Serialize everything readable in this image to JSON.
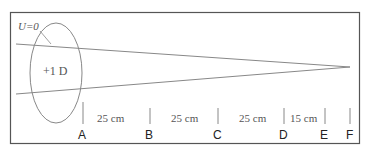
{
  "diagram": {
    "vergence_label": "U=0",
    "lens_label": "+1 D",
    "points": [
      "A",
      "B",
      "C",
      "D",
      "E",
      "F"
    ],
    "segments": [
      {
        "label": "25 cm",
        "from": "A",
        "to": "B"
      },
      {
        "label": "25 cm",
        "from": "B",
        "to": "C"
      },
      {
        "label": "25 cm",
        "from": "C",
        "to": "D"
      },
      {
        "label": "15 cm",
        "from": "D",
        "to": "E"
      }
    ],
    "colors": {
      "frame": "#555555",
      "lines": "#888888",
      "text": "#555555",
      "point_labels": "#222222"
    }
  }
}
